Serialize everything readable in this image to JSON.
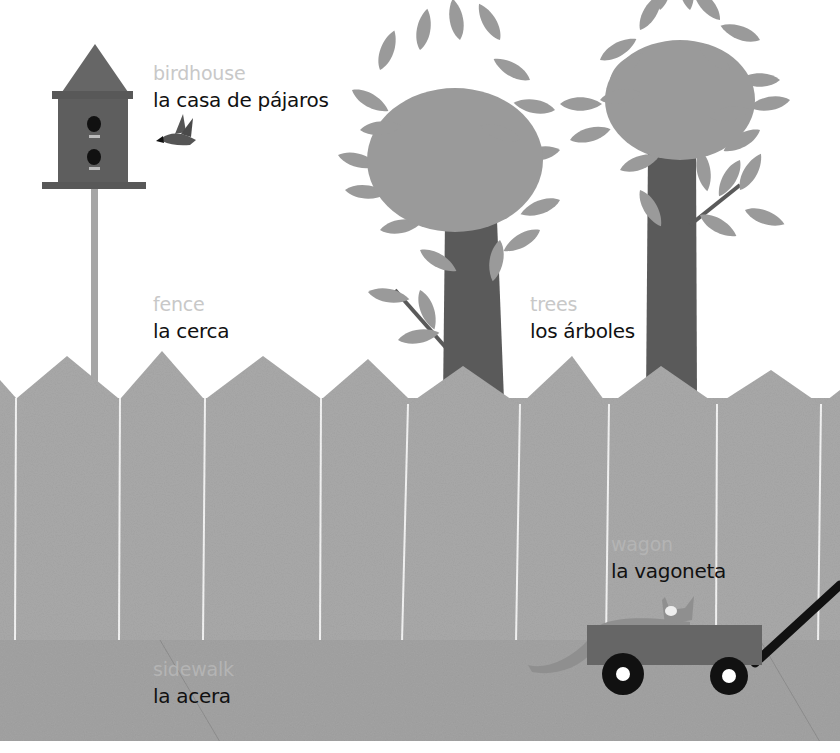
{
  "page": {
    "style": "grayscale cut-paper illustration",
    "colors": {
      "background": "#ffffff",
      "fence": "#a9a9a9",
      "fence_seam": "#f2f2f2",
      "sidewalk": "#a3a3a3",
      "tree_foliage": "#9a9a9a",
      "tree_trunk": "#5a5a5a",
      "birdhouse": "#5e5e5e",
      "birdhouse_roof": "#666666",
      "wagon_body": "#666666",
      "wagon_wheel": "#111111",
      "english_text": "#c8c8c8",
      "spanish_text": "#111111"
    }
  },
  "labels": [
    {
      "id": "birdhouse",
      "english": "birdhouse",
      "spanish": "la casa de pájaros"
    },
    {
      "id": "fence",
      "english": "fence",
      "spanish": "la cerca"
    },
    {
      "id": "trees",
      "english": "trees",
      "spanish": "los árboles"
    },
    {
      "id": "wagon",
      "english": "wagon",
      "spanish": "la vagoneta"
    },
    {
      "id": "sidewalk",
      "english": "sidewalk",
      "spanish": "la acera"
    }
  ],
  "illustration": {
    "objects": [
      "birdhouse",
      "bird",
      "tree-left",
      "tree-right",
      "fence",
      "wagon",
      "cat",
      "sidewalk"
    ]
  }
}
